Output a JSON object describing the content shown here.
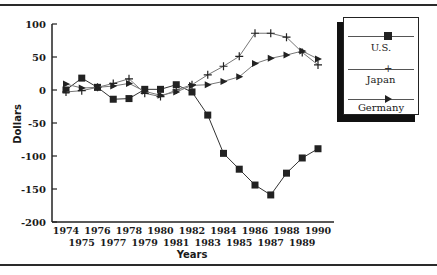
{
  "chart_data": {
    "type": "line",
    "title": "",
    "xlabel": "Years",
    "ylabel": "Dollars",
    "ylim": [
      -200,
      100
    ],
    "yticks": [
      100,
      50,
      0,
      -50,
      -100,
      -150,
      -200
    ],
    "x": [
      1974,
      1975,
      1976,
      1977,
      1978,
      1979,
      1980,
      1981,
      1982,
      1983,
      1984,
      1985,
      1986,
      1987,
      1988,
      1989,
      1990
    ],
    "xtick_labels_top": [
      "1974",
      "1976",
      "1978",
      "1980",
      "1982",
      "1984",
      "1986",
      "1988",
      "1990"
    ],
    "xtick_labels_bottom": [
      "1975",
      "1977",
      "1979",
      "1981",
      "1983",
      "1985",
      "1987",
      "1989"
    ],
    "grid": false,
    "legend_position": "upper right",
    "series": [
      {
        "name": "U.S.",
        "marker": "square",
        "values": [
          0,
          18,
          4,
          -14,
          -13,
          1,
          1,
          8,
          -3,
          -38,
          -96,
          -120,
          -144,
          -159,
          -126,
          -103,
          -89
        ]
      },
      {
        "name": "Japan",
        "marker": "plus",
        "values": [
          -3,
          -1,
          4,
          10,
          17,
          -5,
          -10,
          0,
          8,
          23,
          36,
          51,
          86,
          86,
          80,
          57,
          38
        ]
      },
      {
        "name": "Germany",
        "marker": "triangle-right",
        "values": [
          9,
          3,
          4,
          6,
          10,
          -2,
          -8,
          -3,
          7,
          8,
          13,
          20,
          40,
          48,
          53,
          59,
          47
        ]
      }
    ]
  },
  "legend": {
    "items": [
      {
        "label": "U.S."
      },
      {
        "label": "Japan"
      },
      {
        "label": "Germany"
      }
    ]
  }
}
